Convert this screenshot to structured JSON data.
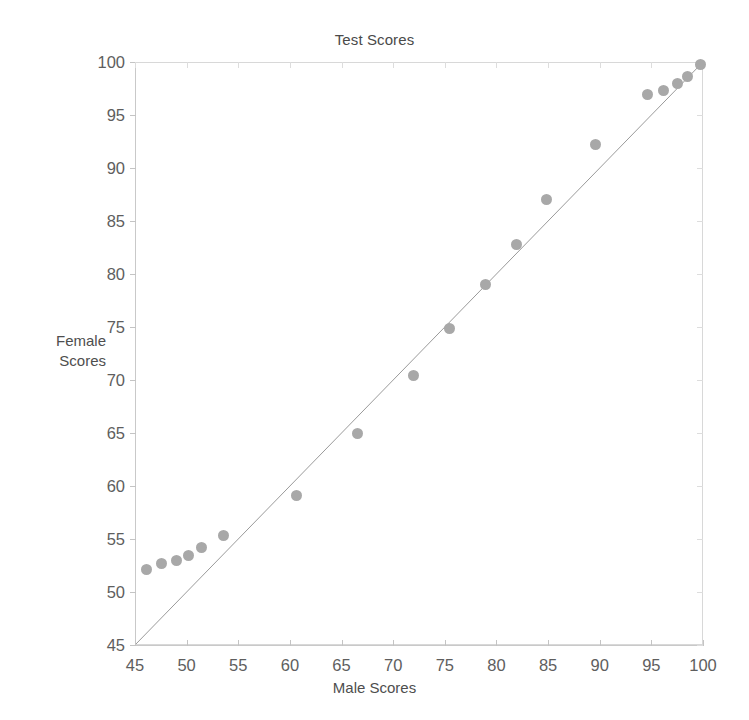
{
  "chart_data": {
    "type": "scatter",
    "title": "Test Scores",
    "xlabel": "Male Scores",
    "ylabel": "Female Scores",
    "ylabel_lines": [
      "Female",
      "Scores"
    ],
    "xlim": [
      45,
      100
    ],
    "ylim": [
      45,
      100
    ],
    "xticks": [
      45,
      50,
      55,
      60,
      65,
      70,
      75,
      80,
      85,
      90,
      95,
      100
    ],
    "yticks": [
      45,
      50,
      55,
      60,
      65,
      70,
      75,
      80,
      85,
      90,
      95,
      100
    ],
    "xtick_labels": [
      "45",
      "50",
      "55",
      "60",
      "65",
      "70",
      "75",
      "80",
      "85",
      "90",
      "95",
      "100"
    ],
    "ytick_labels": [
      "45",
      "50",
      "55",
      "60",
      "65",
      "70",
      "75",
      "80",
      "85",
      "90",
      "95",
      "100"
    ],
    "grid": false,
    "legend": null,
    "marker_color": "#a8a8a8",
    "marker_size": 11,
    "reference_line": {
      "name": "identity-line",
      "type": "y=x",
      "from": [
        45,
        45
      ],
      "to": [
        100,
        100
      ],
      "color": "#9a9a9a"
    },
    "points": [
      {
        "x": 46.1,
        "y": 52.1
      },
      {
        "x": 47.6,
        "y": 52.7
      },
      {
        "x": 49.0,
        "y": 53.0
      },
      {
        "x": 50.2,
        "y": 53.4
      },
      {
        "x": 51.4,
        "y": 54.2
      },
      {
        "x": 53.6,
        "y": 55.3
      },
      {
        "x": 60.6,
        "y": 59.1
      },
      {
        "x": 66.5,
        "y": 65.0
      },
      {
        "x": 72.0,
        "y": 70.4
      },
      {
        "x": 75.5,
        "y": 74.9
      },
      {
        "x": 78.9,
        "y": 79.0
      },
      {
        "x": 81.9,
        "y": 82.8
      },
      {
        "x": 84.8,
        "y": 87.0
      },
      {
        "x": 89.6,
        "y": 92.2
      },
      {
        "x": 94.6,
        "y": 96.9
      },
      {
        "x": 96.2,
        "y": 97.3
      },
      {
        "x": 97.5,
        "y": 98.0
      },
      {
        "x": 98.5,
        "y": 98.6
      },
      {
        "x": 99.8,
        "y": 99.8
      }
    ]
  }
}
